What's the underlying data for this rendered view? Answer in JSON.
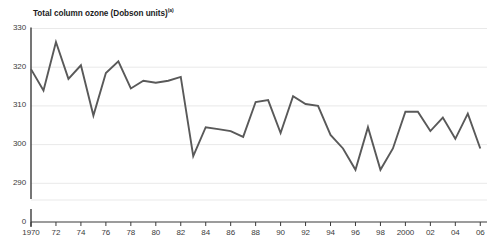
{
  "cut_off_header": "··· ···· ····· ·",
  "axis_title": {
    "text": "Total column ozone (Dobson units)",
    "superscript": "(a)"
  },
  "chart_data": {
    "type": "line",
    "title": "Total column ozone (Dobson units)",
    "xlabel": "",
    "ylabel": "Total column ozone (Dobson units)",
    "ylim": [
      287,
      330
    ],
    "ytick_labels": [
      "330",
      "320",
      "310",
      "300",
      "290",
      "0"
    ],
    "ytick_values": [
      330,
      320,
      310,
      300,
      290,
      0
    ],
    "axis_break": true,
    "grid": true,
    "legend": "none",
    "line_color": "#595959",
    "xtick_labels": [
      "1970",
      "72",
      "74",
      "76",
      "78",
      "80",
      "82",
      "84",
      "86",
      "88",
      "90",
      "92",
      "94",
      "96",
      "98",
      "2000",
      "02",
      "04",
      "06"
    ],
    "xtick_years": [
      1970,
      1972,
      1974,
      1976,
      1978,
      1980,
      1982,
      1984,
      1986,
      1988,
      1990,
      1992,
      1994,
      1996,
      1998,
      2000,
      2002,
      2004,
      2006
    ],
    "x": [
      1970,
      1971,
      1972,
      1973,
      1974,
      1975,
      1976,
      1977,
      1978,
      1979,
      1980,
      1981,
      1982,
      1983,
      1984,
      1985,
      1986,
      1987,
      1988,
      1989,
      1990,
      1991,
      1992,
      1993,
      1994,
      1995,
      1996,
      1997,
      1998,
      1999,
      2000,
      2001,
      2002,
      2003,
      2004,
      2005,
      2006
    ],
    "values": [
      319.5,
      314.0,
      326.5,
      317.0,
      320.5,
      307.5,
      318.5,
      321.5,
      314.5,
      316.5,
      316.0,
      316.5,
      317.5,
      297.0,
      304.5,
      304.0,
      303.5,
      302.0,
      311.0,
      311.5,
      303.0,
      312.5,
      310.5,
      310.0,
      302.5,
      299.0,
      293.5,
      304.5,
      293.5,
      299.0,
      308.5,
      308.5,
      303.5,
      307.0,
      301.5,
      308.0,
      299.0
    ]
  }
}
